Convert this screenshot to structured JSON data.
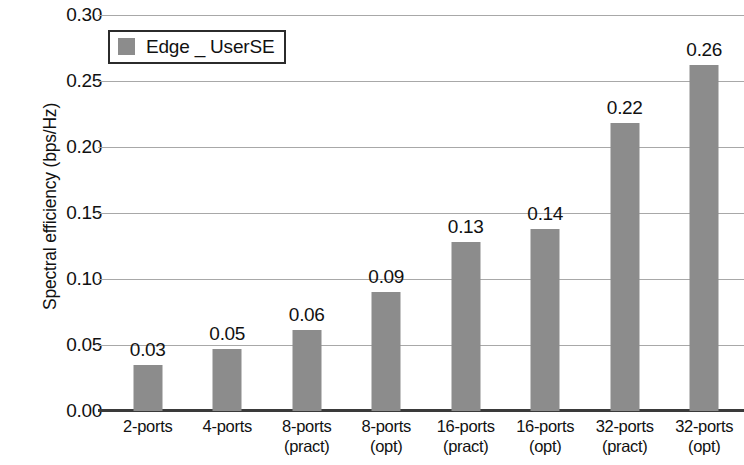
{
  "chart_data": {
    "type": "bar",
    "title": "",
    "xlabel": "",
    "ylabel": "Spectral efficiency (bps/Hz)",
    "ylim": [
      0.0,
      0.3
    ],
    "ytick_labels": [
      "0.30",
      "0.25",
      "0.20",
      "0.15",
      "0.10",
      "0.05",
      "0.00"
    ],
    "ytick_values": [
      0.3,
      0.25,
      0.2,
      0.15,
      0.1,
      0.05,
      0.0
    ],
    "grid": true,
    "legend": {
      "position": "top-left",
      "entries": [
        {
          "label": "Edge _ UserSE",
          "color": "#8c8c8c"
        }
      ]
    },
    "categories": [
      "2-ports",
      "4-ports",
      "8-ports (pract)",
      "8-ports (opt)",
      "16-ports (pract)",
      "16-ports (opt)",
      "32-ports (pract)",
      "32-ports (opt)"
    ],
    "category_lines": [
      {
        "line1": "2-ports",
        "line2": ""
      },
      {
        "line1": "4-ports",
        "line2": ""
      },
      {
        "line1": "8-ports",
        "line2": "(pract)"
      },
      {
        "line1": "8-ports",
        "line2": "(opt)"
      },
      {
        "line1": "16-ports",
        "line2": "(pract)"
      },
      {
        "line1": "16-ports",
        "line2": "(opt)"
      },
      {
        "line1": "32-ports",
        "line2": "(pract)"
      },
      {
        "line1": "32-ports",
        "line2": "(opt)"
      }
    ],
    "series": [
      {
        "name": "Edge _ UserSE",
        "color": "#8c8c8c",
        "values": [
          0.035,
          0.047,
          0.061,
          0.09,
          0.128,
          0.138,
          0.218,
          0.262
        ],
        "data_labels": [
          "0.03",
          "0.05",
          "0.06",
          "0.09",
          "0.13",
          "0.14",
          "0.22",
          "0.26"
        ]
      }
    ]
  },
  "colors": {
    "bar": "#8c8c8c",
    "gridline": "#a8a8a8",
    "axis": "#3a3a3a",
    "text": "#111111",
    "background": "#ffffff"
  }
}
